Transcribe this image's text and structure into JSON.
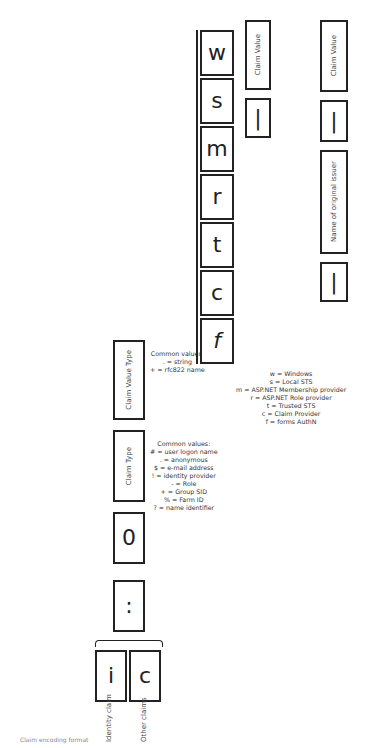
{
  "left_column": {
    "cells": [
      {
        "glyph": "i",
        "label": "Identity claim"
      },
      {
        "glyph": "c",
        "label": "Other claims"
      }
    ]
  },
  "separator_glyph": ":",
  "zero_glyph": "0",
  "claim_type": {
    "label": "Claim Type",
    "common_values_title": "Common values:",
    "common_values": [
      "# = user logon name",
      ". = anonymous",
      "$ = e-mail address",
      "! = identity provider",
      "- = Role",
      "+ = Group SID",
      "% = Farm ID",
      "? = name identifier"
    ]
  },
  "claim_value_type": {
    "label": "Claim Value Type",
    "common_values_title": "Common values:",
    "common_values": [
      ". = string",
      "+ = rfc822 name"
    ]
  },
  "providers": {
    "glyphs": [
      "w",
      "s",
      "m",
      "r",
      "t",
      "c",
      "f"
    ],
    "legend": [
      "w = Windows",
      "s = Local STS",
      "m = ASP.NET Membership provider",
      "r = ASP.NET Role provider",
      "t = Trusted STS",
      "c = Claim Provider",
      "f = forms AuthN"
    ]
  },
  "branch_windows": {
    "pipe": "|",
    "value_label": "Claim Value"
  },
  "branch_trusted": {
    "pipe1": "|",
    "issuer_label": "Name of original issuer",
    "pipe2": "|",
    "value_label": "Claim Value"
  },
  "caption": "Claim encoding format"
}
